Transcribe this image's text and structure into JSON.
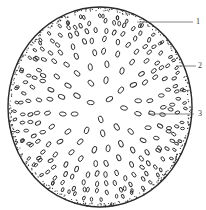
{
  "figure": {
    "type": "botanical cross-section illustration",
    "colors": {
      "stroke": "#2a2a2a",
      "background": "#ffffff"
    },
    "outline": {
      "cx": 100,
      "cy": 107,
      "rx": 92,
      "ry": 100
    },
    "labels": [
      {
        "text": "1",
        "x": 196,
        "y": 18,
        "line": {
          "x1": 137,
          "y1": 22,
          "x2": 193,
          "y2": 22
        }
      },
      {
        "text": "2",
        "x": 198,
        "y": 62,
        "line": {
          "x1": 176,
          "y1": 66,
          "x2": 196,
          "y2": 66
        }
      },
      {
        "text": "3",
        "x": 198,
        "y": 110,
        "line": {
          "x1": 148,
          "y1": 114,
          "x2": 194,
          "y2": 114
        }
      }
    ]
  }
}
